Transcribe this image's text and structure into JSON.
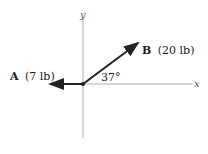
{
  "diagram": {
    "axes": {
      "x_label": "x",
      "y_label": "y"
    },
    "vectors": [
      {
        "name": "A",
        "magnitude_label": "(7 lb)",
        "direction": "negative x-axis"
      },
      {
        "name": "B",
        "magnitude_label": "(20 lb)",
        "angle_label": "37°",
        "direction": "37° above positive x-axis"
      }
    ],
    "angle_label": "37°",
    "colors": {
      "axis": "#999999",
      "vector": "#222222"
    }
  }
}
